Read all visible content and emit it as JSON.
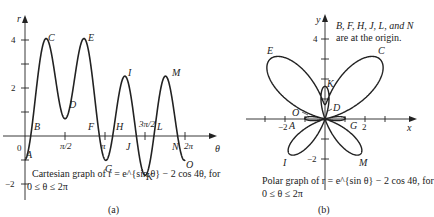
{
  "figure": {
    "panel_a": {
      "caption_line1": "Cartesian graph of r = e^{sin θ} − 2 cos 4θ, for",
      "caption_line2": "0 ≤ θ ≤ 2π",
      "sublabel": "(a)",
      "axis_labels": {
        "x": "θ",
        "y": "r"
      },
      "y_ticks": [
        "4",
        "2",
        "−2"
      ],
      "origin_label": "0",
      "x_ticks": [
        "π/2",
        "π",
        "3π/2",
        "2π"
      ],
      "point_labels": {
        "A": "A",
        "B": "B",
        "C": "C",
        "D": "D",
        "E": "E",
        "F": "F",
        "G": "G",
        "H": "H",
        "I": "I",
        "J": "J",
        "K": "K",
        "L": "L",
        "M": "M",
        "N": "N",
        "O": "O"
      }
    },
    "panel_b": {
      "caption_line1": "Polar graph of r = e^{sin θ} − 2 cos 4θ, for",
      "caption_line2": "0 ≤ θ ≤ 2π",
      "sublabel": "(b)",
      "axis_labels": {
        "x": "x",
        "y": "y"
      },
      "x_ticks": [
        "−2",
        "2"
      ],
      "y_ticks": [
        "4",
        "−2"
      ],
      "note_line1": "B, F, H, J, L, and N",
      "note_line2": "are at the origin.",
      "point_labels": {
        "A": "A",
        "C": "C",
        "D": "D",
        "E": "E",
        "G": "G",
        "I": "I",
        "K": "K",
        "M": "M",
        "O": "O"
      }
    }
  },
  "chart_data": [
    {
      "type": "line",
      "title": "Cartesian graph of r = e^{sin θ} − 2 cos 4θ, for 0 ≤ θ ≤ 2π",
      "xlabel": "θ",
      "ylabel": "r",
      "function": "r = exp(sin θ) − 2 cos 4θ",
      "xlim": [
        0,
        6.2832
      ],
      "ylim": [
        -2,
        4.5
      ],
      "x_tick_labels": [
        "π/2",
        "π",
        "3π/2",
        "2π"
      ],
      "y_tick_labels": [
        "−2",
        "2",
        "4"
      ],
      "labeled_points": [
        {
          "label": "A",
          "theta": 0,
          "r": -1.0
        },
        {
          "label": "B",
          "theta": 0.33,
          "r": 0
        },
        {
          "label": "C",
          "theta": 0.79,
          "r": 4.03
        },
        {
          "label": "D",
          "theta": 1.57,
          "r": 0.72
        },
        {
          "label": "E",
          "theta": 2.36,
          "r": 4.03
        },
        {
          "label": "F",
          "theta": 2.81,
          "r": 0
        },
        {
          "label": "G",
          "theta": 3.14,
          "r": -1.0
        },
        {
          "label": "H",
          "theta": 3.47,
          "r": 0
        },
        {
          "label": "I",
          "theta": 3.93,
          "r": 2.49
        },
        {
          "label": "J",
          "theta": 4.33,
          "r": 0
        },
        {
          "label": "K",
          "theta": 4.71,
          "r": -1.63
        },
        {
          "label": "L",
          "theta": 5.09,
          "r": 0
        },
        {
          "label": "M",
          "theta": 5.5,
          "r": 2.49
        },
        {
          "label": "N",
          "theta": 5.95,
          "r": 0
        },
        {
          "label": "O",
          "theta": 6.2832,
          "r": -1.0
        }
      ],
      "grid": false
    },
    {
      "type": "line",
      "title": "Polar graph of r = e^{sin θ} − 2 cos 4θ, for 0 ≤ θ ≤ 2π",
      "xlabel": "x",
      "ylabel": "y",
      "function": "x = r cos θ, y = r sin θ, r = exp(sin θ) − 2 cos 4θ",
      "xlim": [
        -4.5,
        5
      ],
      "ylim": [
        -3,
        5
      ],
      "x_tick_labels": [
        "−2",
        "2"
      ],
      "y_tick_labels": [
        "−2",
        "4"
      ],
      "annotation": "B, F, H, J, L, and N are at the origin.",
      "grid": false
    }
  ]
}
